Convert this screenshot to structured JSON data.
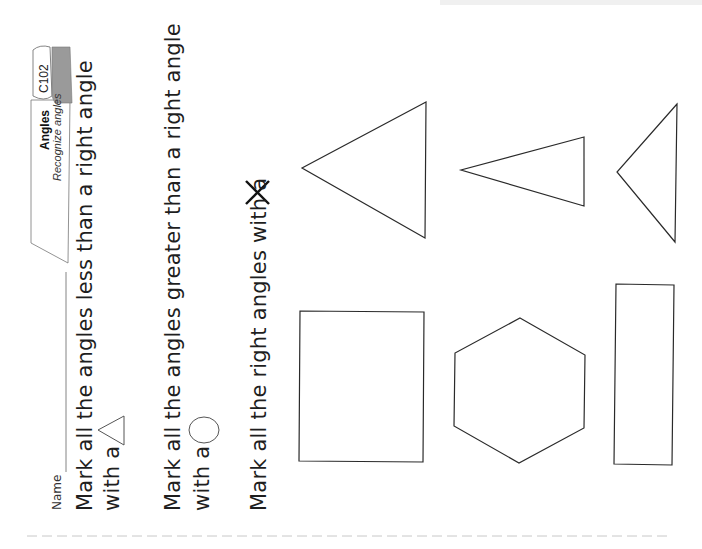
{
  "header": {
    "code": "C102",
    "title": "Angles",
    "subtitle": "Recognize angles",
    "book_color": "#9a9a9a"
  },
  "name_field": {
    "label": "Name"
  },
  "instructions": [
    {
      "line1": "Mark all the angles less than a right angle",
      "line2": "with a",
      "symbol": "triangle-icon"
    },
    {
      "line1": "Mark all the angles greater than a right angle",
      "line2": "with a",
      "symbol": "circle-icon"
    },
    {
      "line1": "Mark all the right angles with a",
      "symbol": "x-mark-icon"
    }
  ],
  "shapes": [
    {
      "name": "large-triangle"
    },
    {
      "name": "narrow-triangle"
    },
    {
      "name": "right-triangle"
    },
    {
      "name": "square"
    },
    {
      "name": "hexagon"
    },
    {
      "name": "rectangle"
    }
  ],
  "colors": {
    "ink": "#2a2a2a",
    "dashed_line": "#c8c8c8"
  }
}
